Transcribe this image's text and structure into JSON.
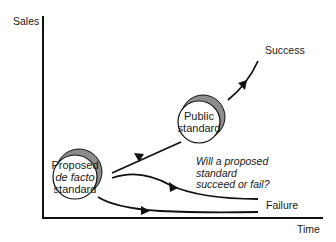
{
  "axes": {
    "y_label": "Sales",
    "x_label": "Time"
  },
  "nodes": {
    "proposed": {
      "line1": "Proposed",
      "line2": "de facto",
      "line3": "standard"
    },
    "public": {
      "line1": "Public",
      "line2": "standard"
    }
  },
  "outcomes": {
    "success": "Success",
    "failure": "Failure"
  },
  "question": {
    "line1": "Will a proposed",
    "line2": "standard",
    "line3": "succeed or fail?"
  },
  "colors": {
    "line": "#111111",
    "shadow": "#8c8c8c",
    "circle_fill": "#ffffff"
  }
}
